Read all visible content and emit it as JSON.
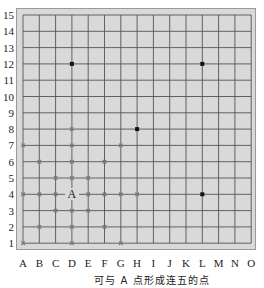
{
  "board": {
    "size": 15,
    "columns": [
      "A",
      "B",
      "C",
      "D",
      "E",
      "F",
      "G",
      "H",
      "I",
      "J",
      "K",
      "L",
      "M",
      "N",
      "O"
    ],
    "rows": [
      "1",
      "2",
      "3",
      "4",
      "5",
      "6",
      "7",
      "8",
      "9",
      "10",
      "11",
      "12",
      "13",
      "14",
      "15"
    ],
    "background_color": "#d9d9d9",
    "line_color": "#555555",
    "black_stones": [
      "D12",
      "L12",
      "H8",
      "L4"
    ],
    "candidate_points": [
      "D8",
      "A7",
      "D7",
      "G7",
      "B6",
      "D6",
      "F6",
      "C5",
      "D5",
      "E5",
      "A4",
      "B4",
      "C4",
      "E4",
      "F4",
      "G4",
      "H4",
      "C3",
      "D3",
      "E3",
      "B2",
      "D2",
      "F2",
      "A1",
      "D1",
      "G1"
    ],
    "labeled_point": {
      "position": "D4",
      "label": "A"
    }
  },
  "caption": "可与 A 点形成连五的点"
}
